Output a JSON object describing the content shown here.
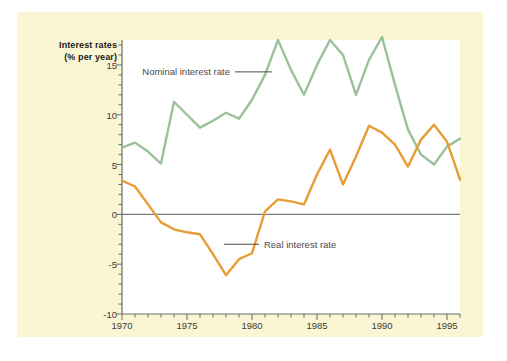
{
  "figure": {
    "background_color": "#faf6d4",
    "plot_background_color": "#ffffff"
  },
  "chart_data": {
    "type": "line",
    "title": "",
    "xlabel": "",
    "ylabel": "Interest rates (% per year)",
    "ylabel_line1": "Interest rates",
    "ylabel_line2": "(% per year)",
    "xlim": [
      1970,
      1996
    ],
    "ylim": [
      -10,
      17.5
    ],
    "grid": false,
    "legend_position": "inline-annotations",
    "y_ticks": [
      15,
      10,
      5,
      0,
      -5,
      -10
    ],
    "y_tick_labels": [
      "15",
      "10",
      "5",
      "0",
      "-5",
      "-10"
    ],
    "y_minor_tick_step": 1,
    "x_ticks": [
      1970,
      1975,
      1980,
      1985,
      1990,
      1995
    ],
    "x_tick_labels": [
      "1970",
      "1975",
      "1980",
      "1985",
      "1990",
      "1995"
    ],
    "x_minor_tick_step": 1,
    "zero_line": 0,
    "zero_line_color": "#7b7b7b",
    "x": [
      1970,
      1971,
      1972,
      1973,
      1974,
      1975,
      1976,
      1977,
      1978,
      1979,
      1980,
      1981,
      1982,
      1983,
      1984,
      1985,
      1986,
      1987,
      1988,
      1989,
      1990,
      1991,
      1992,
      1993,
      1994,
      1995,
      1996
    ],
    "series": [
      {
        "name": "Nominal interest rate",
        "color": "#9bc19b",
        "values": [
          6.7,
          7.2,
          6.3,
          5.1,
          11.3,
          10.0,
          8.7,
          9.4,
          10.2,
          9.6,
          11.5,
          14.0,
          17.5,
          14.5,
          12.0,
          15.0,
          17.5,
          16.0,
          12.0,
          15.5,
          17.8,
          13.0,
          8.5,
          6.0,
          5.0,
          6.8,
          7.6
        ]
      },
      {
        "name": "Real interest rate",
        "color": "#e89c34",
        "values": [
          3.4,
          2.8,
          1.0,
          -0.8,
          -1.5,
          -1.8,
          -2.0,
          -4.0,
          -6.1,
          -4.5,
          -3.9,
          0.3,
          1.5,
          1.3,
          1.0,
          4.0,
          6.5,
          3.0,
          5.8,
          8.9,
          8.2,
          7.0,
          4.8,
          7.5,
          9.0,
          7.3,
          3.5
        ]
      }
    ],
    "annotations": [
      {
        "text": "Nominal interest rate",
        "series": "Nominal interest rate",
        "x_frac": 0.06,
        "y_value": 14.3
      },
      {
        "text": "Real interest rate",
        "series": "Real interest rate",
        "x_frac": 0.42,
        "y_value": -3.0
      }
    ]
  }
}
